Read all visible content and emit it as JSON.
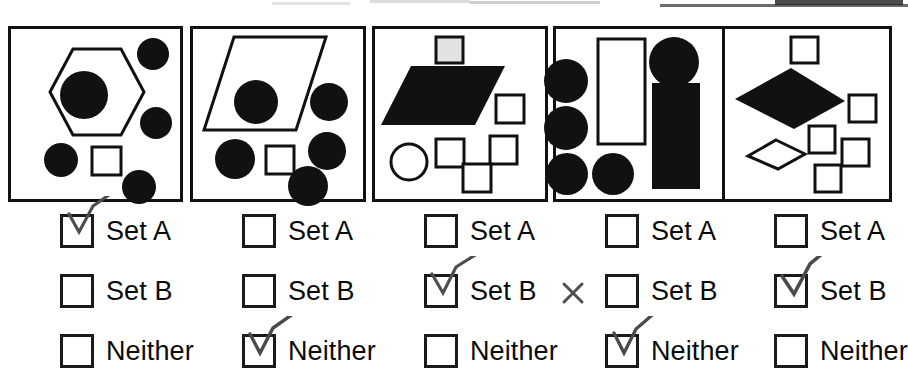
{
  "worksheet": {
    "title": "Set classification worksheet",
    "option_labels": [
      "Set A",
      "Set B",
      "Neither"
    ],
    "columns": [
      {
        "id": "panel-1",
        "shapes_description": "large outlined hexagon containing a filled black circle, four filled black circles, one outlined white square",
        "answers": [
          {
            "label": "Set A",
            "checked": true,
            "mark": "checkmark"
          },
          {
            "label": "Set B",
            "checked": false,
            "mark": ""
          },
          {
            "label": "Neither",
            "checked": false,
            "mark": ""
          }
        ]
      },
      {
        "id": "panel-2",
        "shapes_description": "large outlined parallelogram containing a filled black circle, four filled black circles, one outlined white square",
        "answers": [
          {
            "label": "Set A",
            "checked": false,
            "mark": ""
          },
          {
            "label": "Set B",
            "checked": false,
            "mark": ""
          },
          {
            "label": "Neither",
            "checked": true,
            "mark": "checkmark"
          }
        ]
      },
      {
        "id": "panel-3",
        "shapes_description": "large filled black parallelogram, five outlined white squares, one outlined white circle",
        "answers": [
          {
            "label": "Set A",
            "checked": false,
            "mark": ""
          },
          {
            "label": "Set B",
            "checked": true,
            "mark": "checkmark-and-x"
          },
          {
            "label": "Neither",
            "checked": false,
            "mark": ""
          }
        ]
      },
      {
        "id": "panel-4",
        "shapes_description": "four filled black circles, one outlined white rectangle, one filled black circle, one filled black rectangle",
        "answers": [
          {
            "label": "Set A",
            "checked": false,
            "mark": ""
          },
          {
            "label": "Set B",
            "checked": false,
            "mark": ""
          },
          {
            "label": "Neither",
            "checked": true,
            "mark": "checkmark"
          }
        ]
      },
      {
        "id": "panel-5",
        "shapes_description": "large filled black rhombus, one outlined white rhombus, five outlined white squares",
        "answers": [
          {
            "label": "Set A",
            "checked": false,
            "mark": ""
          },
          {
            "label": "Set B",
            "checked": true,
            "mark": "checkmark"
          },
          {
            "label": "Neither",
            "checked": false,
            "mark": ""
          }
        ]
      }
    ],
    "colors": {
      "ink": "#111111",
      "paper": "#ffffff",
      "pencil": "#5a5a5a"
    }
  }
}
